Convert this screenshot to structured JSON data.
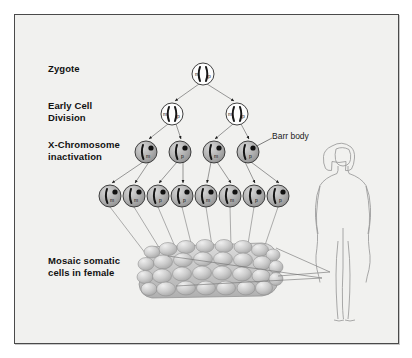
{
  "figure": {
    "background_color": "#f1f1ef",
    "border_color": "#4a4a4a",
    "page_color": "#ffffff"
  },
  "labels": {
    "zygote": "Zygote",
    "early_cell_division": "Early Cell\nDivision",
    "x_inactivation": "X-Chromosome\ninactivation",
    "mosaic": "Mosaic somatic\ncells in female",
    "barr_body": "Barr body"
  },
  "chromosome_marks": {
    "maternal": "m",
    "paternal": "p"
  },
  "rows": [
    {
      "stage": "zygote",
      "cell_fill": "#ffffff",
      "cells": [
        {
          "x": 203,
          "y": 74,
          "r": 11,
          "marks": [
            "m",
            "p"
          ],
          "inactivated": null
        }
      ]
    },
    {
      "stage": "early-cell-division",
      "cell_fill": "#ffffff",
      "cells": [
        {
          "x": 172,
          "y": 114,
          "r": 11,
          "marks": [
            "m",
            "p"
          ],
          "inactivated": null
        },
        {
          "x": 237,
          "y": 114,
          "r": 11,
          "marks": [
            "m",
            "p"
          ],
          "inactivated": null
        }
      ]
    },
    {
      "stage": "x-inactivation",
      "cell_fill": "#b4b4b4",
      "cells": [
        {
          "x": 146,
          "y": 152,
          "r": 11,
          "active": "m",
          "inactivated": "p"
        },
        {
          "x": 180,
          "y": 152,
          "r": 11,
          "active": "p",
          "inactivated": "m"
        },
        {
          "x": 214,
          "y": 152,
          "r": 11,
          "active": "m",
          "inactivated": "p"
        },
        {
          "x": 248,
          "y": 152,
          "r": 11,
          "active": "p",
          "inactivated": "m"
        }
      ]
    },
    {
      "stage": "somatic-cells",
      "cell_fill": "#b4b4b4",
      "cells": [
        {
          "x": 110,
          "y": 196,
          "r": 11,
          "active": "m"
        },
        {
          "x": 134,
          "y": 196,
          "r": 11,
          "active": "m"
        },
        {
          "x": 158,
          "y": 196,
          "r": 11,
          "active": "p"
        },
        {
          "x": 182,
          "y": 196,
          "r": 11,
          "active": "p"
        },
        {
          "x": 206,
          "y": 196,
          "r": 11,
          "active": "m"
        },
        {
          "x": 230,
          "y": 196,
          "r": 11,
          "active": "m"
        },
        {
          "x": 254,
          "y": 196,
          "r": 11,
          "active": "p"
        },
        {
          "x": 278,
          "y": 196,
          "r": 11,
          "active": "p"
        }
      ]
    }
  ],
  "tissue": {
    "description": "mosaic somatic cell patch",
    "cell_count": 46,
    "fill_light": "#e2e2e2",
    "fill_mid": "#bdbdbd",
    "outline": "#8c8c8c"
  },
  "female_figure": {
    "description": "outline of adult female body",
    "outline_color": "#8e8e8e"
  },
  "counts": {
    "zygote_cells": 1,
    "early_division_cells": 2,
    "inactivation_cells": 4,
    "somatic_cells": 8
  }
}
